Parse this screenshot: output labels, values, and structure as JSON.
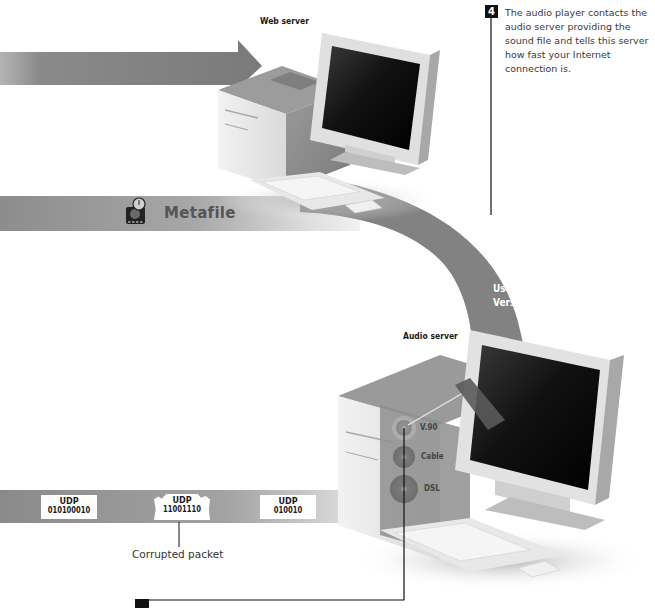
{
  "diagram": {
    "web_server": {
      "label": "Web server"
    },
    "audio_server": {
      "label": "Audio server"
    },
    "metafile_band": {
      "label": "Metafile",
      "icon": "metafile-icon"
    },
    "curved_arrow": {
      "line1": "Use V.90",
      "line2": "Version"
    },
    "step4": {
      "number": "4",
      "text": "The audio player contacts the audio server providing the sound file and tells this server how fast your Internet connection is."
    },
    "step5": {
      "number": "5"
    },
    "connection_options": [
      {
        "label": "V.90"
      },
      {
        "label": "Cable"
      },
      {
        "label": "DSL"
      }
    ],
    "udp_band": {
      "packets": [
        {
          "title": "UDP",
          "bits": "010100010",
          "corrupted": false
        },
        {
          "title": "UDP",
          "bits": "11001110",
          "corrupted": true
        },
        {
          "title": "UDP",
          "bits": "010010",
          "corrupted": false
        }
      ],
      "corrupted_caption": "Corrupted packet"
    },
    "colors": {
      "band_gray": "#7a7a7a",
      "band_light": "#d8d8d8",
      "screen_black": "#111111",
      "case_light": "#e6e6e6",
      "case_dark": "#8a8a8a",
      "step_box": "#111111"
    }
  }
}
